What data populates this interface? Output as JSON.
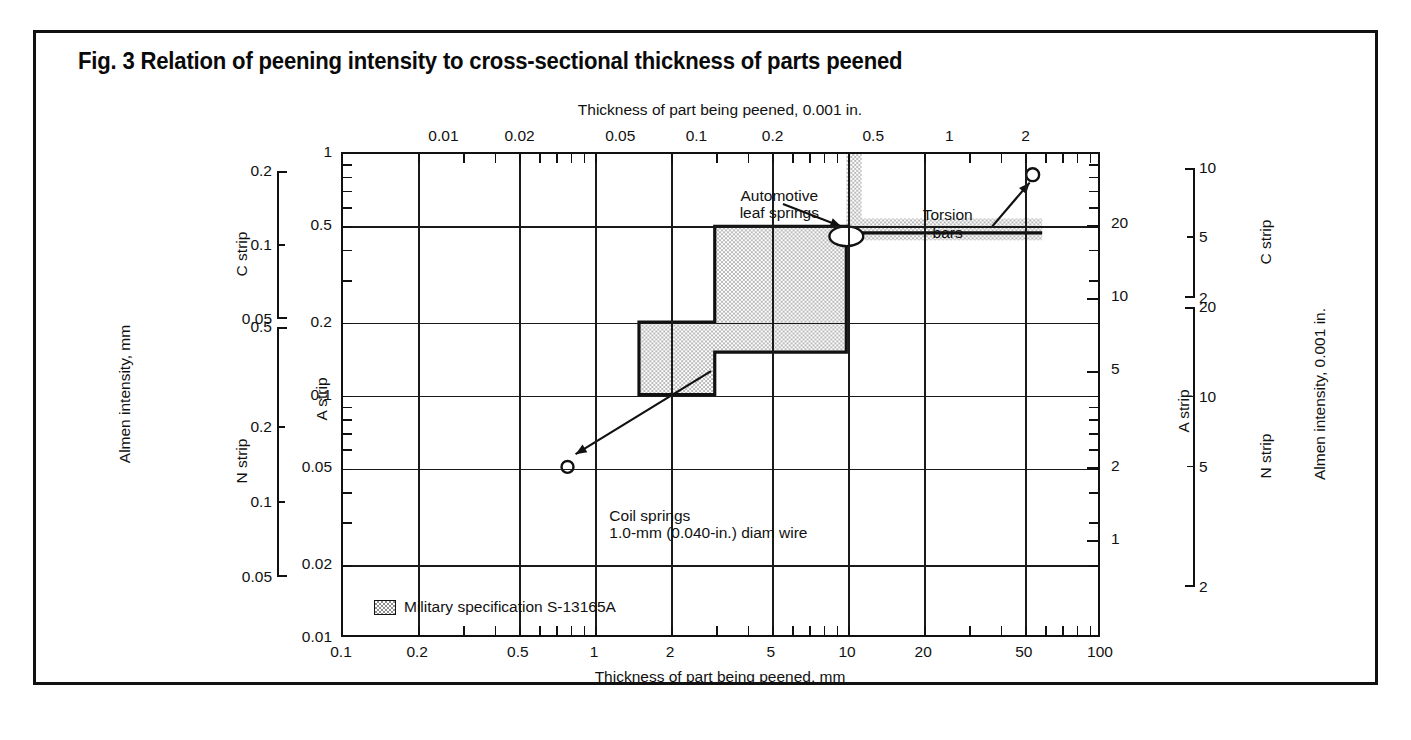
{
  "figure": {
    "title": "Fig. 3  Relation of peening intensity to cross-sectional thickness of parts peened"
  },
  "legend": {
    "swatch_name": "milspec-swatch",
    "label": "Military specification  S-13165A"
  },
  "axes": {
    "top": {
      "title": "Thickness of part being peened, 0.001 in.",
      "ticks": [
        "0.01",
        "0.02",
        "0.05",
        "0.1",
        "0.2",
        "0.5",
        "1",
        "2"
      ]
    },
    "bottom": {
      "title": "Thickness of part being peened, mm",
      "ticks": [
        "0.1",
        "0.2",
        "0.5",
        "1",
        "2",
        "5",
        "10",
        "20",
        "50",
        "100"
      ]
    },
    "left_main": {
      "ticks": [
        "1",
        "0.5",
        "0.2",
        "0.1",
        "0.05",
        "0.02",
        "0.01"
      ]
    },
    "right_main": {
      "name": "A strip",
      "ticks": [
        "20",
        "10",
        "5",
        "2",
        "1"
      ]
    },
    "left_outer": {
      "title": "Almen intensity, mm",
      "scales": [
        {
          "name": "C strip",
          "ticks": [
            "0.2",
            "0.1",
            "0.05"
          ]
        },
        {
          "name": "N strip",
          "ticks": [
            "0.5",
            "0.2",
            "0.1",
            "0.05"
          ]
        }
      ],
      "inner_name": "A strip"
    },
    "right_outer": {
      "title": "Almen intensity, 0.001 in.",
      "scales": [
        {
          "name": "C strip",
          "ticks": [
            "10",
            "5",
            "2"
          ]
        },
        {
          "name": "N strip",
          "ticks": [
            "20",
            "10",
            "5",
            "2"
          ]
        }
      ]
    }
  },
  "annotations": {
    "automotive": {
      "line1": "Automotive",
      "line2": "leaf springs"
    },
    "torsion": {
      "line1": "Torsion",
      "line2": "bars"
    },
    "coil": {
      "line1": "Coil springs",
      "line2": "1.0-mm (0.040-in.) diam wire"
    }
  },
  "colors": {
    "ink": "#111111",
    "shade": "#c9c9c9",
    "paper": "#ffffff"
  },
  "chart_data": {
    "type": "area",
    "title": "Fig. 3  Relation of peening intensity to cross-sectional thickness of parts peened",
    "xlabel": "Thickness of part being peened, mm",
    "ylabel": "Almen intensity, mm",
    "xscale": "log",
    "yscale": "log",
    "xlim": [
      0.1,
      100
    ],
    "ylim": [
      0.01,
      1
    ],
    "grid": true,
    "legend_position": "bottom-left-inside",
    "x_ticks": [
      0.1,
      0.2,
      0.5,
      1,
      2,
      5,
      10,
      20,
      50,
      100
    ],
    "y_ticks": [
      0.01,
      0.02,
      0.05,
      0.1,
      0.2,
      0.5,
      1
    ],
    "top_axis": {
      "label": "Thickness of part being peened, 0.001 in.",
      "ticks": [
        0.01,
        0.02,
        0.05,
        0.1,
        0.2,
        0.5,
        1,
        2
      ]
    },
    "right_axis": {
      "label": "Almen intensity, 0.001 in.",
      "ticks": [
        1,
        2,
        5,
        10,
        20
      ]
    },
    "series": [
      {
        "name": "Military specification S-13165A",
        "kind": "shaded-stepped-polygon",
        "fill": "#c9c9c9",
        "vertices_xy": [
          [
            1.5,
            0.2
          ],
          [
            3.0,
            0.2
          ],
          [
            3.0,
            0.5
          ],
          [
            10.0,
            0.5
          ],
          [
            10.0,
            0.15
          ],
          [
            3.0,
            0.15
          ],
          [
            3.0,
            0.1
          ],
          [
            1.5,
            0.1
          ]
        ],
        "note": "x in mm, y in Almen intensity mm; stepped band of recommended intensity"
      },
      {
        "name": "Torsion bars band",
        "kind": "shaded-band",
        "fill": "#c9c9c9",
        "x_range": [
          10.0,
          60.0
        ],
        "y_range": [
          0.47,
          0.5
        ]
      },
      {
        "name": "Vertical transition band",
        "kind": "shaded-band",
        "fill": "#c9c9c9",
        "x_range": [
          10.0,
          11.5
        ],
        "y_range": [
          0.5,
          1.0
        ]
      }
    ],
    "markers": [
      {
        "label": "Coil springs 1.0-mm (0.040-in.) diam wire",
        "x": 0.78,
        "y": 0.05,
        "shape": "open-circle"
      },
      {
        "label": "Automotive leaf springs",
        "x": 10.0,
        "y": 0.47,
        "shape": "open-ellipse"
      },
      {
        "label": "Torsion bars",
        "x": 55.0,
        "y": 0.82,
        "shape": "open-circle"
      }
    ],
    "annotations": [
      {
        "text": "Automotive leaf springs",
        "x": 6.0,
        "y": 0.66
      },
      {
        "text": "Torsion bars",
        "x": 25.0,
        "y": 0.55
      },
      {
        "text": "Coil springs 1.0-mm (0.040-in.) diam wire",
        "x": 1.1,
        "y": 0.033
      }
    ]
  }
}
